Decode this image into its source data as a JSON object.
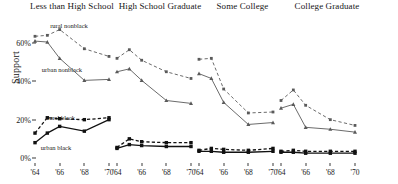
{
  "chart_data": {
    "type": "line",
    "title": "",
    "xlabel": "",
    "ylabel": "Support",
    "ylim": [
      0,
      70
    ],
    "yticks": [
      0,
      20,
      40,
      60
    ],
    "ytick_labels": [
      "0%",
      "20%",
      "40%",
      "60%"
    ],
    "x": [
      1964,
      1965,
      1966,
      1968,
      1970
    ],
    "xticks": [
      1964,
      1966,
      1968,
      1970
    ],
    "xtick_labels": [
      "'64",
      "'66",
      "'68",
      "'70"
    ],
    "grid": false,
    "legend_position": "inline-annotations",
    "panel_titles": [
      "Less than High School",
      "High School Graduate",
      "Some College",
      "College Graduate"
    ],
    "series_names": [
      "rural nonblack",
      "urban nonblack",
      "rural black",
      "urban black"
    ],
    "series_styles": [
      "dashed-gray",
      "solid-gray",
      "dashed-black",
      "solid-black"
    ],
    "panels": [
      {
        "title": "Less than High School",
        "series": [
          {
            "name": "rural nonblack",
            "style": "dashed-gray",
            "values": [
              63.5,
              64.0,
              67.0,
              57.0,
              53.0
            ]
          },
          {
            "name": "urban nonblack",
            "style": "solid-gray",
            "values": [
              61.0,
              60.5,
              52.0,
              40.5,
              41.0
            ]
          },
          {
            "name": "rural black",
            "style": "dashed-black",
            "values": [
              13.0,
              21.0,
              20.5,
              20.0,
              21.0
            ]
          },
          {
            "name": "urban black",
            "style": "solid-black",
            "values": [
              8.0,
              13.0,
              16.5,
              14.0,
              20.0
            ]
          }
        ]
      },
      {
        "title": "High School Graduate",
        "series": [
          {
            "name": "rural nonblack",
            "style": "dashed-gray",
            "values": [
              52.0,
              56.5,
              51.0,
              45.0,
              41.5
            ]
          },
          {
            "name": "urban nonblack",
            "style": "solid-gray",
            "values": [
              45.0,
              46.5,
              40.5,
              30.0,
              28.5
            ]
          },
          {
            "name": "rural black",
            "style": "dashed-black",
            "values": [
              5.5,
              10.0,
              8.5,
              8.0,
              8.0
            ]
          },
          {
            "name": "urban black",
            "style": "solid-black",
            "values": [
              5.0,
              7.0,
              6.5,
              6.0,
              6.0
            ]
          }
        ]
      },
      {
        "title": "Some College",
        "series": [
          {
            "name": "rural nonblack",
            "style": "dashed-gray",
            "values": [
              51.5,
              52.0,
              36.0,
              23.5,
              24.0
            ]
          },
          {
            "name": "urban nonblack",
            "style": "solid-gray",
            "values": [
              44.0,
              41.5,
              29.0,
              17.5,
              18.5
            ]
          },
          {
            "name": "rural black",
            "style": "dashed-black",
            "values": [
              4.0,
              5.0,
              4.5,
              4.0,
              5.0
            ]
          },
          {
            "name": "urban black",
            "style": "solid-black",
            "values": [
              3.5,
              3.5,
              3.0,
              3.0,
              3.5
            ]
          }
        ]
      },
      {
        "title": "College Graduate",
        "series": [
          {
            "name": "rural nonblack",
            "style": "dashed-gray",
            "values": [
              30.0,
              35.5,
              27.5,
              20.0,
              17.0
            ]
          },
          {
            "name": "urban nonblack",
            "style": "solid-gray",
            "values": [
              26.0,
              28.0,
              16.0,
              15.0,
              13.5
            ]
          },
          {
            "name": "rural black",
            "style": "dashed-black",
            "values": [
              3.5,
              4.0,
              3.5,
              3.5,
              3.5
            ]
          },
          {
            "name": "urban black",
            "style": "solid-black",
            "values": [
              3.0,
              3.0,
              2.5,
              2.5,
              2.5
            ]
          }
        ]
      }
    ],
    "annotations": [
      {
        "text": "rural nonblack",
        "panel": 0,
        "x_px": 69,
        "y_px": 25
      },
      {
        "text": "urban nonblack",
        "panel": 0,
        "x_px": 62,
        "y_px": 69
      },
      {
        "text": "rural black",
        "panel": 0,
        "x_px": 61,
        "y_px": 117
      },
      {
        "text": "urban black",
        "panel": 0,
        "x_px": 56,
        "y_px": 147
      }
    ]
  }
}
